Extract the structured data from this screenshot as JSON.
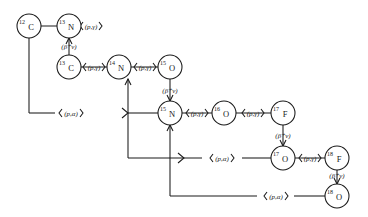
{
  "diagram": {
    "ink_color": "#1a1a1a",
    "background": "#ffffff",
    "nodes": [
      {
        "id": "c12",
        "mass": "12",
        "element": "C",
        "cx": 29,
        "cy": 26,
        "r": 12
      },
      {
        "id": "n13",
        "mass": "13",
        "element": "N",
        "cx": 69,
        "cy": 26,
        "r": 12
      },
      {
        "id": "c13",
        "mass": "13",
        "element": "C",
        "cx": 69,
        "cy": 67,
        "r": 12
      },
      {
        "id": "n14",
        "mass": "14",
        "element": "N",
        "cx": 119,
        "cy": 67,
        "r": 12
      },
      {
        "id": "o15",
        "mass": "15",
        "element": "O",
        "cx": 170,
        "cy": 67,
        "r": 12
      },
      {
        "id": "n15",
        "mass": "15",
        "element": "N",
        "cx": 170,
        "cy": 113,
        "r": 12
      },
      {
        "id": "o16",
        "mass": "16",
        "element": "O",
        "cx": 224,
        "cy": 113,
        "r": 12
      },
      {
        "id": "f17",
        "mass": "17",
        "element": "F",
        "cx": 283,
        "cy": 113,
        "r": 12
      },
      {
        "id": "o17",
        "mass": "17",
        "element": "O",
        "cx": 283,
        "cy": 158,
        "r": 12
      },
      {
        "id": "f18",
        "mass": "18",
        "element": "F",
        "cx": 337,
        "cy": 158,
        "r": 12
      },
      {
        "id": "o18",
        "mass": "18",
        "element": "O",
        "cx": 337,
        "cy": 196,
        "r": 12
      }
    ],
    "labels": [
      {
        "id": "lbl-c12-n13",
        "text": "(p,γ)",
        "x": 91,
        "y": 29,
        "anchor": "middle"
      },
      {
        "id": "lbl-n13-c13",
        "text": "(β⁺ν)",
        "x": 69,
        "y": 49,
        "anchor": "middle"
      },
      {
        "id": "lbl-c13-n14",
        "text": "(p,γ)",
        "x": 94,
        "y": 70,
        "anchor": "middle"
      },
      {
        "id": "lbl-n14-o15",
        "text": "(p,γ)",
        "x": 145,
        "y": 70,
        "anchor": "middle"
      },
      {
        "id": "lbl-o15-n15",
        "text": "(β⁺ν)",
        "x": 170,
        "y": 93,
        "anchor": "middle"
      },
      {
        "id": "lbl-n15-o16",
        "text": "(p,γ)",
        "x": 197,
        "y": 116,
        "anchor": "middle"
      },
      {
        "id": "lbl-o16-f17",
        "text": "(p,γ)",
        "x": 253,
        "y": 116,
        "anchor": "middle"
      },
      {
        "id": "lbl-f17-o17",
        "text": "(β⁺ν)",
        "x": 283,
        "y": 138,
        "anchor": "middle"
      },
      {
        "id": "lbl-o17-f18",
        "text": "(p,γ)",
        "x": 310,
        "y": 161,
        "anchor": "middle"
      },
      {
        "id": "lbl-f18-o18",
        "text": "(β⁺ν)",
        "x": 337,
        "y": 178,
        "anchor": "middle"
      },
      {
        "id": "lbl-pa-top",
        "text": "(p,α)",
        "x": 71,
        "y": 115,
        "anchor": "middle"
      },
      {
        "id": "lbl-pa-mid",
        "text": "(p,α)",
        "x": 222,
        "y": 161,
        "anchor": "middle"
      },
      {
        "id": "lbl-pa-bot",
        "text": "(p,α)",
        "x": 276,
        "y": 199,
        "anchor": "middle"
      }
    ],
    "reaction_types": {
      "proton_capture": "(p,γ)",
      "beta_plus_decay": "(β⁺ν)",
      "proton_alpha": "(p,α)"
    },
    "branches": [
      {
        "id": "branch-1",
        "name": "CN cycle",
        "from": "n15",
        "to": "c12",
        "reaction": "(p,α)"
      },
      {
        "id": "branch-2",
        "name": "NO cycle",
        "from": "o17",
        "to": "n14",
        "reaction": "(p,α)"
      },
      {
        "id": "branch-3",
        "name": "OF cycle",
        "from": "o18",
        "to": "n15",
        "reaction": "(p,α)"
      }
    ]
  }
}
